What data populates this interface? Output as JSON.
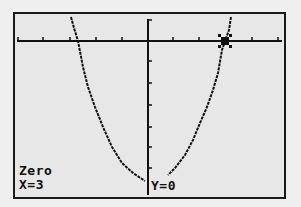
{
  "screen": {
    "type": "graphing-calculator",
    "mode_label": "Zero",
    "x_readout": "X=3",
    "y_readout": "Y=0",
    "colors": {
      "lcd_background": "#e7e7e7",
      "pixel": "#111111",
      "bezel": "#efefef"
    }
  },
  "graph": {
    "function": "parabola opening upward",
    "roots": [
      -3,
      3
    ],
    "cursor": {
      "x": 3,
      "y": 0,
      "icon": "crosshair-cursor-icon"
    },
    "x_axis": {
      "ticks_left": 5,
      "ticks_right": 5
    },
    "y_axis": {
      "ticks_below": 6
    }
  }
}
